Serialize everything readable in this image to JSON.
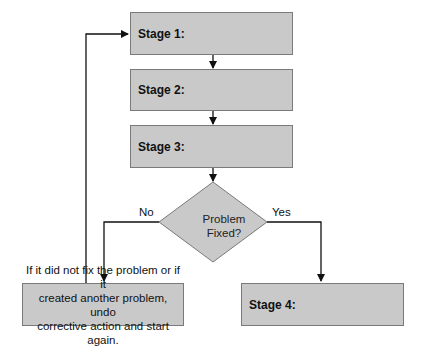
{
  "stages": [
    {
      "label": "Stage 1:"
    },
    {
      "label": "Stage 2:"
    },
    {
      "label": "Stage 3:"
    },
    {
      "label": "Stage 4:"
    }
  ],
  "decision": {
    "line1": "Problem",
    "line2": "Fixed?",
    "no_label": "No",
    "yes_label": "Yes"
  },
  "undo_note": {
    "line1": "If it did not fix the problem or if it",
    "line2": "created another problem, undo",
    "line3": "corrective action and start again."
  },
  "colors": {
    "box_fill": "#c9c9c9",
    "box_border": "#7a7a7a",
    "line": "#111111"
  }
}
